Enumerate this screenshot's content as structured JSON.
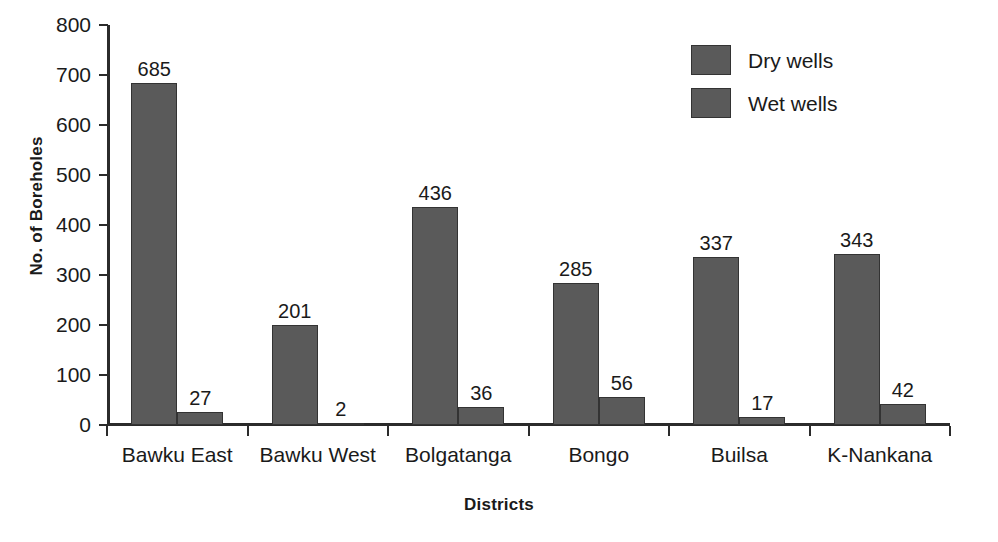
{
  "chart_data": {
    "type": "bar",
    "title": "",
    "xlabel": "Districts",
    "ylabel": "No. of Boreholes",
    "categories": [
      "Bawku East",
      "Bawku West",
      "Bolgatanga",
      "Bongo",
      "Builsa",
      "K-Nankana"
    ],
    "series": [
      {
        "name": "Dry wells",
        "values": [
          685,
          201,
          436,
          285,
          337,
          343
        ],
        "color": "#5a5a5a"
      },
      {
        "name": "Wet wells",
        "values": [
          27,
          2,
          36,
          56,
          17,
          42
        ],
        "color": "#5a5a5a"
      }
    ],
    "ylim": [
      0,
      800
    ],
    "yticks": [
      0,
      100,
      200,
      300,
      400,
      500,
      600,
      700,
      800
    ],
    "ytick_labels": [
      "0",
      "100",
      "200",
      "300",
      "400",
      "500",
      "600",
      "700",
      "800"
    ],
    "grid": false,
    "legend_position": "top-right",
    "bar_labels": true
  },
  "legend": {
    "entries": [
      {
        "label": "Dry wells"
      },
      {
        "label": "Wet wells"
      }
    ]
  }
}
